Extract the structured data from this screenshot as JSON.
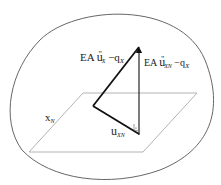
{
  "diagram": {
    "title": "",
    "shapes": {
      "body_outline": "closed-curve",
      "plane": "parallelogram",
      "triangle": "force-triangle"
    },
    "labels": {
      "force_left": {
        "prefix": "EA",
        "var": "u",
        "primes": "''",
        "sub": "X",
        "minus": "−",
        "q": "q",
        "q_sub": "X"
      },
      "force_right": {
        "prefix": "EA",
        "var": "u",
        "primes": "''",
        "sub": "XN",
        "minus": "−",
        "q": "q",
        "q_sub": "X"
      },
      "axis": {
        "var": "x",
        "sub": "N"
      },
      "displacement": {
        "var": "u",
        "sub": "XN"
      }
    },
    "colors": {
      "outline": "#555555",
      "plane": "#aaaaaa",
      "triangle": "#111111"
    },
    "right_angle_marker": true
  }
}
